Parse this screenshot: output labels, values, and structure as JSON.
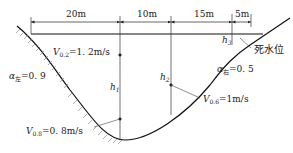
{
  "diagram": {
    "type": "river-cross-section",
    "dimensions": [
      {
        "label": "20m",
        "from_x": 31,
        "to_x": 120
      },
      {
        "label": "10m",
        "from_x": 120,
        "to_x": 171
      },
      {
        "label": "15m",
        "from_x": 171,
        "to_x": 232
      },
      {
        "label": "5m",
        "from_x": 232,
        "to_x": 251
      }
    ],
    "verticals": [
      {
        "label": "h",
        "sub": "1",
        "x": 120
      },
      {
        "label": "h",
        "sub": "2",
        "x": 171
      },
      {
        "label": "h",
        "sub": "3",
        "x": 232
      }
    ],
    "velocities": [
      {
        "label": "V",
        "sub": "0.2",
        "value": "=1. 2m/s"
      },
      {
        "label": "V",
        "sub": "0.8",
        "value": "=0. 8m/s"
      },
      {
        "label": "V",
        "sub": "0.6",
        "value": "=1m/s"
      }
    ],
    "coefficients": [
      {
        "label": "α",
        "sub": "左",
        "value": "=0. 9"
      },
      {
        "label": "α",
        "sub": "右",
        "value": "=0. 5"
      }
    ],
    "water_level_label": "死水位",
    "colors": {
      "line": "#1a1a1a",
      "hatch": "#888888",
      "background": "#ffffff"
    }
  }
}
